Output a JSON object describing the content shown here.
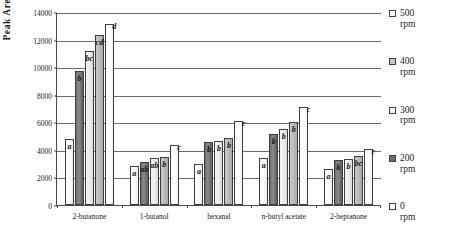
{
  "chart_data": {
    "type": "bar",
    "title": "",
    "xlabel": "",
    "ylabel": "Peak Area",
    "ylim": [
      0,
      14000
    ],
    "ytick_step": 2000,
    "yticks": [
      "0",
      "2000",
      "4000",
      "6000",
      "8000",
      "10000",
      "12000",
      "14000"
    ],
    "grid": true,
    "legend_position": "right",
    "categories": [
      "2-butanone",
      "1-butanol",
      "hexanal",
      "n-butyl acetate",
      "2-heptanone"
    ],
    "series": [
      {
        "name": "0 rpm",
        "swatch": "#ffffff",
        "values": [
          4800,
          2820,
          2990,
          3400,
          2640
        ],
        "annotations": [
          "a",
          "a",
          "a",
          "a",
          "a"
        ]
      },
      {
        "name": "200 rpm",
        "swatch": "#6e6e6e",
        "values": [
          9700,
          3140,
          4580,
          5150,
          3240
        ],
        "annotations": [
          "b",
          "ab",
          "b",
          "b",
          "b"
        ]
      },
      {
        "name": "300 rpm",
        "swatch": "#f3f3f3",
        "values": [
          11200,
          3400,
          4650,
          5530,
          3320
        ],
        "annotations": [
          "bc",
          "ab",
          "b",
          "b",
          "b"
        ]
      },
      {
        "name": "400 rpm",
        "swatch": "#c9c9c9",
        "values": [
          12300,
          3480,
          4880,
          6050,
          3590
        ],
        "annotations": [
          "cd",
          "b",
          "b",
          "b",
          "bc"
        ]
      },
      {
        "name": "500 rpm",
        "swatch": "#ffffff",
        "values": [
          13150,
          4330,
          6060,
          7140,
          4030
        ],
        "annotations": [
          "d",
          "c",
          "c",
          "c",
          "c"
        ]
      }
    ]
  },
  "legend": {
    "items": [
      {
        "label": "500",
        "unit": "rpm",
        "swatch": "#ffffff"
      },
      {
        "label": "400",
        "unit": "rpm",
        "swatch": "#c9c9c9"
      },
      {
        "label": "300",
        "unit": "rpm",
        "swatch": "#f7f7f7"
      },
      {
        "label": "200",
        "unit": "rpm",
        "swatch": "#6e6e6e"
      },
      {
        "label": "0",
        "unit": "rpm",
        "swatch": "#ffffff"
      }
    ]
  }
}
